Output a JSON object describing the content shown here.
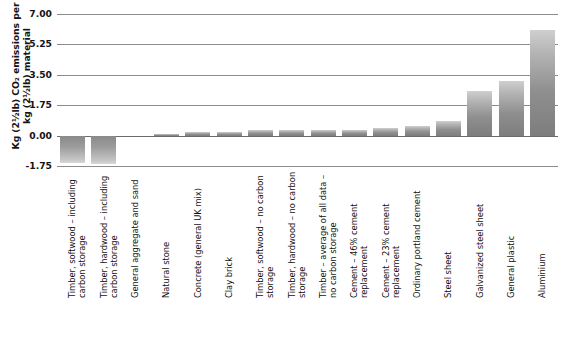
{
  "chart_data": {
    "type": "bar",
    "title": "",
    "subtitle": "",
    "xlabel": "",
    "ylabel": "Kg (2½lb) CO2 emissions per kg (2½lb) material",
    "ylabel_line1": "Kg (2½lb) CO₂ emissions per",
    "ylabel_line2": "kg (2½lb) material",
    "ylim": [
      -1.75,
      7.0
    ],
    "ytick_values": [
      7.0,
      5.25,
      3.5,
      1.75,
      0.0,
      -1.75
    ],
    "ytick_labels": [
      "7.00",
      "5.25",
      "3.50",
      "1.75",
      "0.00",
      "-1.75"
    ],
    "grid": true,
    "legend": "none",
    "categories": [
      "Timber, softwood – including carbon storage",
      "Timber, hardwood – including carbon storage",
      "General aggregate and sand",
      "Natural stone",
      "Concrete (general UK mix)",
      "Clay brick",
      "Timber, softwood – no carbon storage",
      "Timber, hardwood – no carbon storage",
      "Timber – average of all data – no carbon storage",
      "Cement – 46% cement replacement",
      "Cement – 23% cement replacement",
      "Ordinary portland cement",
      "Steel sheet",
      "Galvanized steel sheet",
      "General plastic",
      "Aluminium"
    ],
    "values": [
      -1.6,
      -1.62,
      0.0,
      0.12,
      0.19,
      0.19,
      0.31,
      0.31,
      0.34,
      0.34,
      0.44,
      0.55,
      0.82,
      2.55,
      3.12,
      6.1
    ],
    "colors": {
      "bar_light": "#cfcfcf",
      "bar_dark": "#7d7d7d",
      "gridline": "#8c8c8c",
      "axis_text": "#141414",
      "background": "#ffffff"
    }
  }
}
